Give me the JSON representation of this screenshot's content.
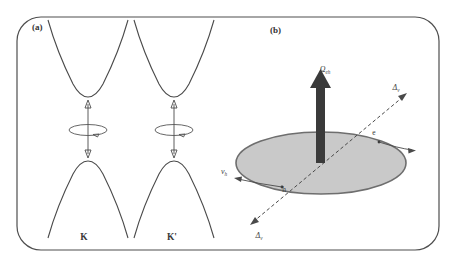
{
  "figure": {
    "panels": [
      {
        "id": "a",
        "label": "(a)",
        "description": "band structure at K and K' valleys",
        "valleys": [
          {
            "label": "K"
          },
          {
            "label": "K'"
          }
        ]
      },
      {
        "id": "b",
        "label": "(b)",
        "description": "electron-hole pair on Bloch sphere plane",
        "labels": {
          "omega": "Ω",
          "omega_sub": "eh",
          "delta_upper": "Δ",
          "delta_upper_sub": "v",
          "delta_lower": "Δ",
          "delta_lower_sub": "v",
          "velocity": "v",
          "velocity_sub": "h",
          "electron": "e",
          "hole": "h"
        }
      }
    ],
    "colors": {
      "plane_fill": "#c9c9c9",
      "plane_stroke": "#6e6e6e",
      "curve_stroke": "#4a4a4a",
      "frame_stroke": "#4f4f4f",
      "omega_arrow": "#3a3a3a",
      "background": "#ffffff"
    }
  }
}
